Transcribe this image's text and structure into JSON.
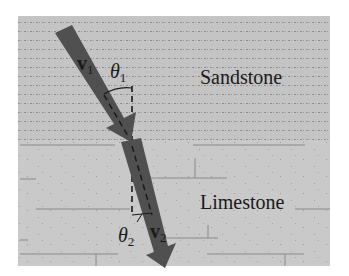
{
  "diagram": {
    "layers": [
      {
        "name": "Sandstone",
        "position": "upper"
      },
      {
        "name": "Limestone",
        "position": "lower"
      }
    ],
    "vectors": [
      {
        "symbol": "v",
        "subscript": "1",
        "medium": "Sandstone",
        "role": "incident"
      },
      {
        "symbol": "v",
        "subscript": "2",
        "medium": "Limestone",
        "role": "refracted"
      }
    ],
    "angles": [
      {
        "symbol": "θ",
        "subscript": "1",
        "measured_from": "normal"
      },
      {
        "symbol": "θ",
        "subscript": "2",
        "measured_from": "normal"
      }
    ],
    "colors": {
      "background": "#ffffff",
      "sandstone": "#c4c4c4",
      "limestone": "#c9c9c9",
      "arrow": "#505050",
      "dashed_normal": "#1a1a1a",
      "texture_lines": "#8a8a8a"
    }
  }
}
